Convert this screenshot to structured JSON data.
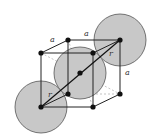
{
  "diagram": {
    "labels": {
      "edge_top_left": "a",
      "edge_top_back": "a",
      "edge_right": "a",
      "radius_upper": "r",
      "radius_lower": "r"
    },
    "colors": {
      "sphere_fill": "#c8c8c8",
      "sphere_stroke": "#555555",
      "edge": "#222222",
      "hidden_edge": "#999999",
      "atom": "#111111"
    }
  }
}
